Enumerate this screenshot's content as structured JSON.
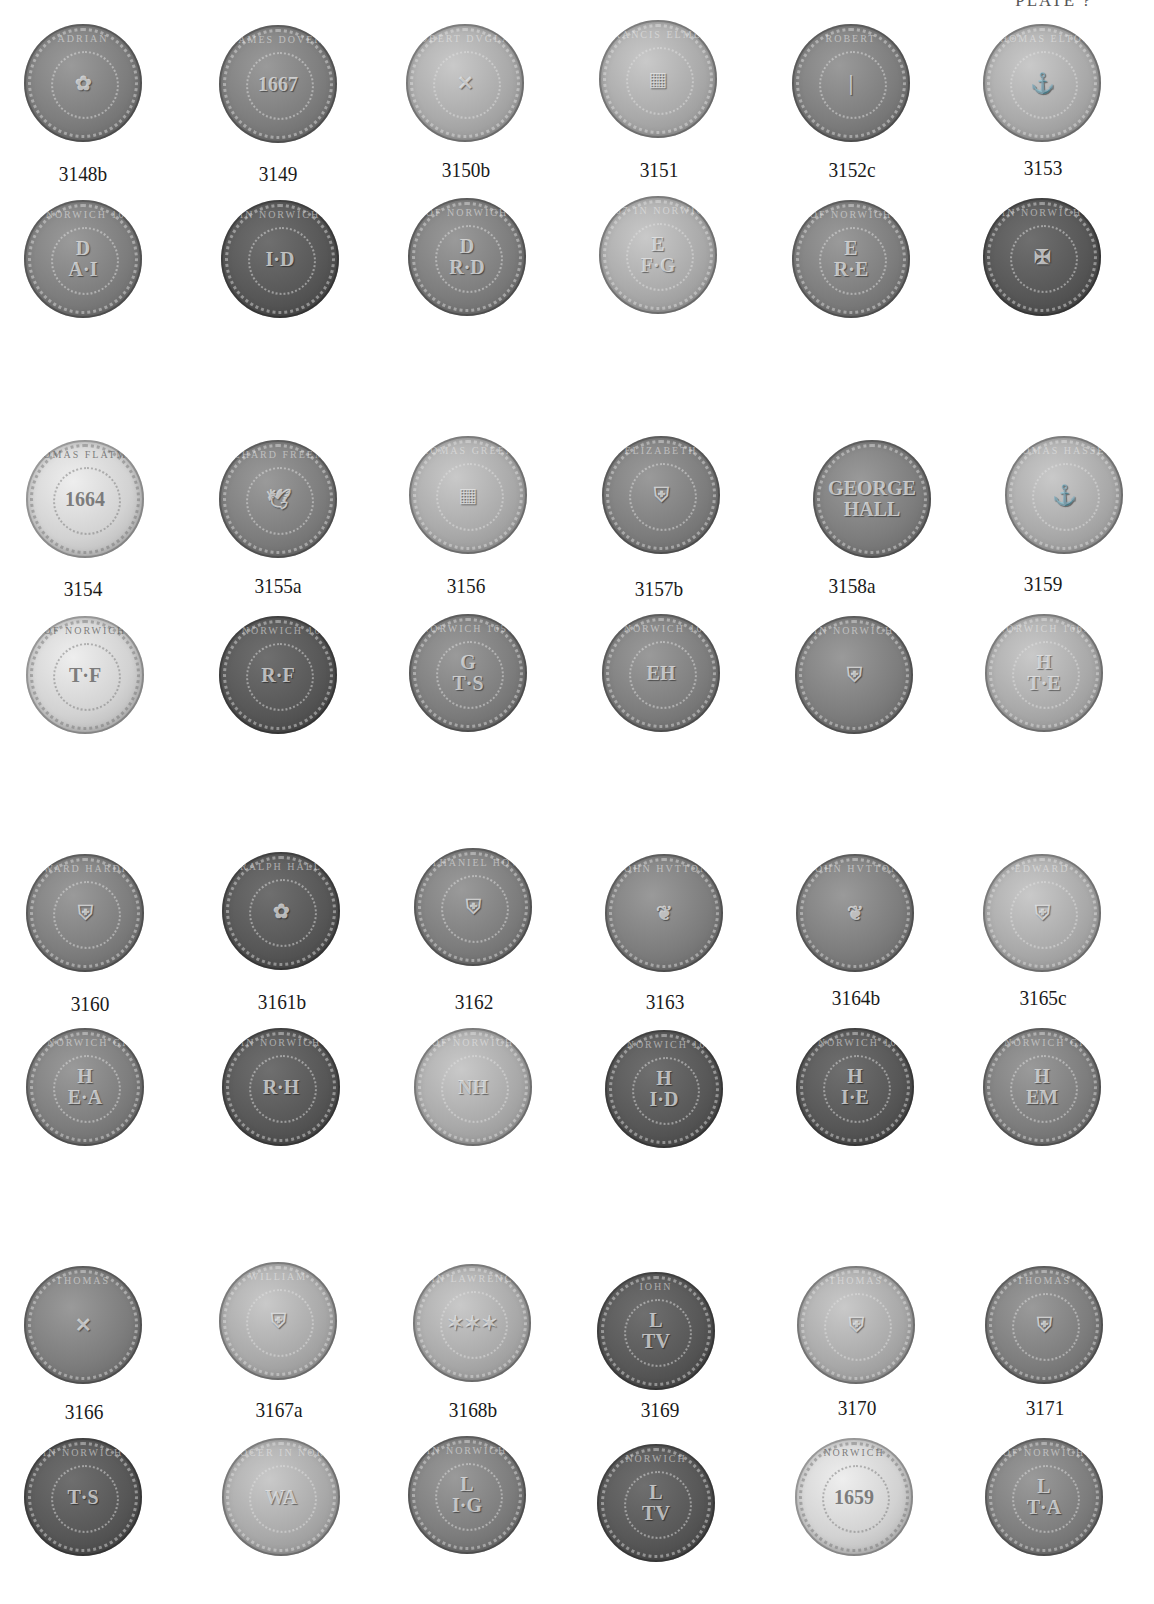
{
  "plate": {
    "header": "PLATE ?"
  },
  "groups": [
    {
      "coins": [
        {
          "id": "3148b",
          "obverse": {
            "legend": "ADRIAN",
            "field": "✿"
          },
          "reverse": {
            "legend": "IN NORWICH 1665",
            "field": "D\nA·I"
          }
        },
        {
          "id": "3149",
          "obverse": {
            "legend": "IAMES DOVER",
            "field": "1667"
          },
          "reverse": {
            "legend": "IN NORWICH",
            "field": "I·D"
          }
        },
        {
          "id": "3150b",
          "obverse": {
            "legend": "ROBERT DVGLAS",
            "field": "✕"
          },
          "reverse": {
            "legend": "OF NORWICH",
            "field": "D\nR·D"
          }
        },
        {
          "id": "3151",
          "obverse": {
            "legend": "FRANCIS ELMER",
            "field": "▦"
          },
          "reverse": {
            "legend": "1667 IN NORWICH",
            "field": "E\nF·G"
          }
        },
        {
          "id": "3152c",
          "obverse": {
            "legend": "ROBERT",
            "field": "|"
          },
          "reverse": {
            "legend": "OF NORWICH",
            "field": "E\nR·E"
          }
        },
        {
          "id": "3153",
          "obverse": {
            "legend": "THOMAS ELTON",
            "field": "⚓"
          },
          "reverse": {
            "legend": "IN NORWICH",
            "field": "✠"
          }
        }
      ]
    },
    {
      "coins": [
        {
          "id": "3154",
          "obverse": {
            "legend": "THOMAS FLATMAN",
            "field": "1664"
          },
          "reverse": {
            "legend": "OF NORWICH",
            "field": "T·F"
          }
        },
        {
          "id": "3155a",
          "obverse": {
            "legend": "RICHARD FREEMAN",
            "field": "🕊"
          },
          "reverse": {
            "legend": "OF NORWICH 1657",
            "field": "R·F"
          }
        },
        {
          "id": "3156",
          "obverse": {
            "legend": "THOMAS GREENE",
            "field": "▦"
          },
          "reverse": {
            "legend": "NORWICH 1656",
            "field": "G\nT·S"
          }
        },
        {
          "id": "3157b",
          "obverse": {
            "legend": "ELIZABETH",
            "field": "⛨"
          },
          "reverse": {
            "legend": "IN NORWICH 1667",
            "field": "EH"
          }
        },
        {
          "id": "3158a",
          "obverse": {
            "legend": "",
            "field": "GEORGE\nHALL"
          },
          "reverse": {
            "legend": "IN NORWICH",
            "field": "⛨"
          }
        },
        {
          "id": "3159",
          "obverse": {
            "legend": "THOMAS HASSET OF",
            "field": "⚓"
          },
          "reverse": {
            "legend": "NORWICH 1665",
            "field": "H\nT·E"
          }
        }
      ]
    },
    {
      "coins": [
        {
          "id": "3160",
          "obverse": {
            "legend": "EDWARD HARDING",
            "field": "⛨"
          },
          "reverse": {
            "legend": "OF NORWICH GROCER",
            "field": "H\nE·A"
          }
        },
        {
          "id": "3161b",
          "obverse": {
            "legend": "RALPH HALL",
            "field": "✿"
          },
          "reverse": {
            "legend": "IN NORWICH",
            "field": "R·H"
          }
        },
        {
          "id": "3162",
          "obverse": {
            "legend": "NATHANIEL HOWLET",
            "field": "⛨"
          },
          "reverse": {
            "legend": "OF NORWICH",
            "field": "NH"
          }
        },
        {
          "id": "3163",
          "obverse": {
            "legend": "IOHN HVTTON",
            "field": "❦"
          },
          "reverse": {
            "legend": "IN NORWICH 1657",
            "field": "H\nI·D"
          }
        },
        {
          "id": "3164b",
          "obverse": {
            "legend": "IOHN HVTTON",
            "field": "❦"
          },
          "reverse": {
            "legend": "IN NORWICH 1667",
            "field": "H\nI·E"
          }
        },
        {
          "id": "3165c",
          "obverse": {
            "legend": "EDWARD",
            "field": "⛨"
          },
          "reverse": {
            "legend": "OF NORWICH GROCER",
            "field": "H\nEM"
          }
        }
      ]
    },
    {
      "coins": [
        {
          "id": "3166",
          "obverse": {
            "legend": "THOMAS",
            "field": "✕"
          },
          "reverse": {
            "legend": "IN NORWICH",
            "field": "T·S"
          }
        },
        {
          "id": "3167a",
          "obverse": {
            "legend": "WILLIAM",
            "field": "⛨"
          },
          "reverse": {
            "legend": "GROCER IN NORWICH",
            "field": "WA"
          }
        },
        {
          "id": "3168b",
          "obverse": {
            "legend": "IOHN LAWRENCE 1653",
            "field": "✶✶✶"
          },
          "reverse": {
            "legend": "IN NORWICH",
            "field": "L\nI·G"
          }
        },
        {
          "id": "3169",
          "obverse": {
            "legend": "IOHN",
            "field": "L\nTV"
          },
          "reverse": {
            "legend": "NORWICH",
            "field": "L\nTV"
          }
        },
        {
          "id": "3170",
          "obverse": {
            "legend": "THOMAS",
            "field": "⛨"
          },
          "reverse": {
            "legend": "NORWICH",
            "field": "1659"
          }
        },
        {
          "id": "3171",
          "obverse": {
            "legend": "THOMAS",
            "field": "⛨"
          },
          "reverse": {
            "legend": "OF NORWICH",
            "field": "L\nT·A"
          }
        }
      ]
    }
  ]
}
